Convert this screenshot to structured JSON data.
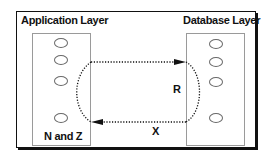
{
  "diagram": {
    "left_layer": {
      "title": "Application Layer",
      "oval_count": 4,
      "label": "N and Z"
    },
    "right_layer": {
      "title": "Database Layer",
      "oval_count": 4
    },
    "connections": [
      {
        "from": "Application Layer",
        "to": "Database Layer",
        "style": "dotted",
        "label": "R"
      },
      {
        "from": "Database Layer",
        "to": "Application Layer",
        "style": "dotted",
        "label": "X"
      }
    ],
    "colors": {
      "stroke": "#111111",
      "inner_box_border": "#9a9a9a",
      "oval_border": "#6a6a6a"
    }
  }
}
